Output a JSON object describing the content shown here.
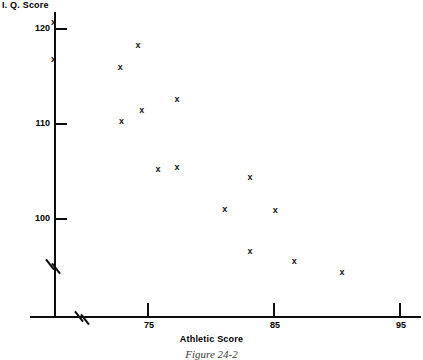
{
  "chart_data": {
    "type": "scatter",
    "title": "Figure 24-2",
    "xlabel": "Athletic Score",
    "ylabel": "I. Q. Score",
    "marker": "x",
    "grid": false,
    "legend": null,
    "xlim": [
      66,
      96
    ],
    "ylim": [
      93,
      122
    ],
    "x_ticks": [
      75,
      85,
      95
    ],
    "y_ticks": [
      100,
      110,
      120
    ],
    "x_tick_labels": [
      "75",
      "85",
      "95"
    ],
    "y_tick_labels": [
      "100",
      "110",
      "120"
    ],
    "x_axis_break": true,
    "y_axis_break": true,
    "x": [
      67.5,
      67.5,
      72.8,
      74.2,
      72.9,
      74.5,
      77.3,
      75.8,
      77.3,
      83.1,
      81.1,
      85.1,
      83.1,
      86.6,
      90.4
    ],
    "y": [
      120.7,
      116.8,
      115.9,
      118.3,
      110.3,
      111.4,
      112.6,
      105.2,
      105.4,
      104.4,
      101.0,
      100.9,
      96.6,
      95.5,
      94.4
    ],
    "points": [
      {
        "x": 67.5,
        "y": 120.7
      },
      {
        "x": 67.5,
        "y": 116.8
      },
      {
        "x": 72.8,
        "y": 115.9
      },
      {
        "x": 74.2,
        "y": 118.3
      },
      {
        "x": 72.9,
        "y": 110.3
      },
      {
        "x": 74.5,
        "y": 111.4
      },
      {
        "x": 77.3,
        "y": 112.6
      },
      {
        "x": 75.8,
        "y": 105.2
      },
      {
        "x": 77.3,
        "y": 105.4
      },
      {
        "x": 83.1,
        "y": 104.4
      },
      {
        "x": 81.1,
        "y": 101.0
      },
      {
        "x": 85.1,
        "y": 100.9
      },
      {
        "x": 83.1,
        "y": 96.6
      },
      {
        "x": 86.6,
        "y": 95.5
      },
      {
        "x": 90.4,
        "y": 94.4
      }
    ]
  },
  "labels": {
    "y_axis_title": "I. Q. Score",
    "x_axis_title": "Athletic Score",
    "caption": "Figure 24-2"
  }
}
